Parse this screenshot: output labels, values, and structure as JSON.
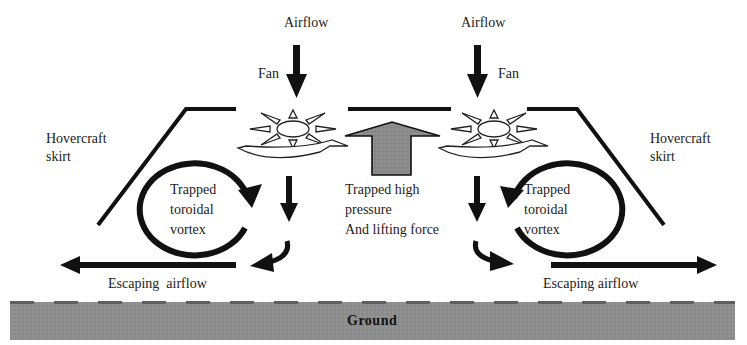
{
  "diagram": {
    "type": "hovercraft-airflow",
    "labels": {
      "airflow_left": "Airflow",
      "airflow_right": "Airflow",
      "fan_left": "Fan",
      "fan_right": "Fan",
      "skirt_left_line1": "Hovercraft",
      "skirt_left_line2": "skirt",
      "skirt_right_line1": "Hovercraft",
      "skirt_right_line2": "skirt",
      "vortex_left_line1": "Trapped",
      "vortex_left_line2": "toroidal",
      "vortex_left_line3": "vortex",
      "vortex_right_line1": "Trapped",
      "vortex_right_line2": "toroidal",
      "vortex_right_line3": "vortex",
      "pressure_line1": "Trapped high",
      "pressure_line2": "pressure",
      "pressure_line3": "And lifting force",
      "escaping_left": "Escaping  airflow",
      "escaping_right": "Escaping airflow",
      "ground": "Ground"
    },
    "colors": {
      "line": "#111111",
      "ground": "#8e8e8e",
      "ground_dash": "#5a5a5a",
      "lift_arrow": "#8a8a8a",
      "background": "#ffffff"
    }
  }
}
